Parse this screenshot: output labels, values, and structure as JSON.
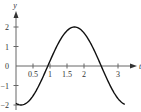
{
  "chart_data": {
    "type": "line",
    "title": "",
    "xlabel": "t",
    "ylabel": "y",
    "xlim": [
      0,
      3.3
    ],
    "ylim": [
      -2.1,
      2.6
    ],
    "grid": false,
    "legend": null,
    "x_ticks": [
      0.5,
      1,
      1.5,
      2,
      3
    ],
    "x_tick_labels": [
      "0.5",
      "1",
      "1.5",
      "2",
      "3"
    ],
    "y_ticks": [
      -2,
      -1,
      0,
      1,
      2
    ],
    "y_tick_labels": [
      "-2",
      "-1",
      "0",
      "1",
      "2"
    ],
    "series": [
      {
        "name": "y(t)",
        "x": [
          0.0,
          0.15,
          0.3,
          0.5,
          0.7,
          0.9,
          1.1,
          1.3,
          1.5,
          1.7,
          1.9,
          2.1,
          2.3,
          2.45,
          2.6,
          2.8,
          3.0,
          3.2
        ],
        "values": [
          -1.91,
          -2.0,
          -1.91,
          -1.53,
          -0.94,
          -0.25,
          0.47,
          1.17,
          1.71,
          1.98,
          1.93,
          1.6,
          1.02,
          0.26,
          -0.33,
          -1.03,
          -1.62,
          -1.96
        ]
      }
    ],
    "colors": {
      "curve": "#111111",
      "axes": "#555555"
    }
  }
}
